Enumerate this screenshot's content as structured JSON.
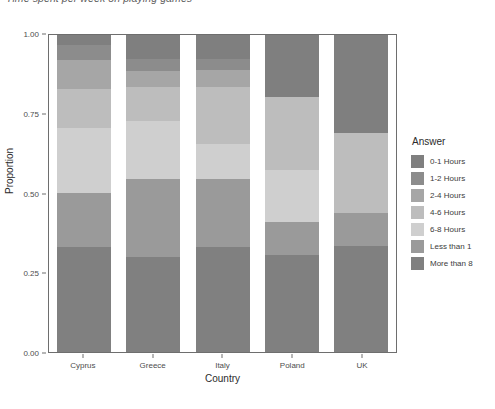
{
  "chart_data": {
    "type": "bar",
    "stacked": true,
    "stack_mode": "proportion",
    "title": "Time spent per week on playing games",
    "xlabel": "Country",
    "ylabel": "Proportion",
    "ylim": [
      0,
      1
    ],
    "yticks": [
      0.0,
      0.25,
      0.5,
      0.75,
      1.0
    ],
    "ytick_labels": [
      "0.00",
      "0.25",
      "0.50",
      "0.75",
      "1.00"
    ],
    "grid": false,
    "legend_title": "Answer",
    "legend_position": "right",
    "categories": [
      "Cyprus",
      "Greece",
      "Italy",
      "Poland",
      "UK"
    ],
    "series": [
      {
        "name": "0-1 Hours",
        "color": "#7f7f7f",
        "values": [
          0.03,
          0.075,
          0.075,
          0.195,
          0.31
        ]
      },
      {
        "name": "1-2 Hours",
        "color": "#8c8c8c",
        "values": [
          0.05,
          0.04,
          0.035,
          0.0,
          0.0
        ]
      },
      {
        "name": "2-4 Hours",
        "color": "#a6a6a6",
        "values": [
          0.09,
          0.05,
          0.055,
          0.0,
          0.0
        ]
      },
      {
        "name": "4-6 Hours",
        "color": "#bdbdbd",
        "values": [
          0.125,
          0.105,
          0.18,
          0.23,
          0.25
        ]
      },
      {
        "name": "6-8 Hours",
        "color": "#cfcfcf",
        "values": [
          0.205,
          0.185,
          0.11,
          0.165,
          0.0
        ]
      },
      {
        "name": "Less than 1",
        "color": "#9a9a9a",
        "values": [
          0.17,
          0.245,
          0.215,
          0.105,
          0.105
        ]
      },
      {
        "name": "More than 8",
        "color": "#808080",
        "values": [
          0.33,
          0.3,
          0.33,
          0.305,
          0.335
        ]
      }
    ],
    "legend_entries": [
      {
        "label": "0-1 Hours",
        "color": "#7f7f7f"
      },
      {
        "label": "1-2 Hours",
        "color": "#8c8c8c"
      },
      {
        "label": "2-4 Hours",
        "color": "#a6a6a6"
      },
      {
        "label": "4-6 Hours",
        "color": "#bdbdbd"
      },
      {
        "label": "6-8 Hours",
        "color": "#cfcfcf"
      },
      {
        "label": "Less than 1",
        "color": "#9a9a9a"
      },
      {
        "label": "More than 8",
        "color": "#808080"
      }
    ]
  }
}
